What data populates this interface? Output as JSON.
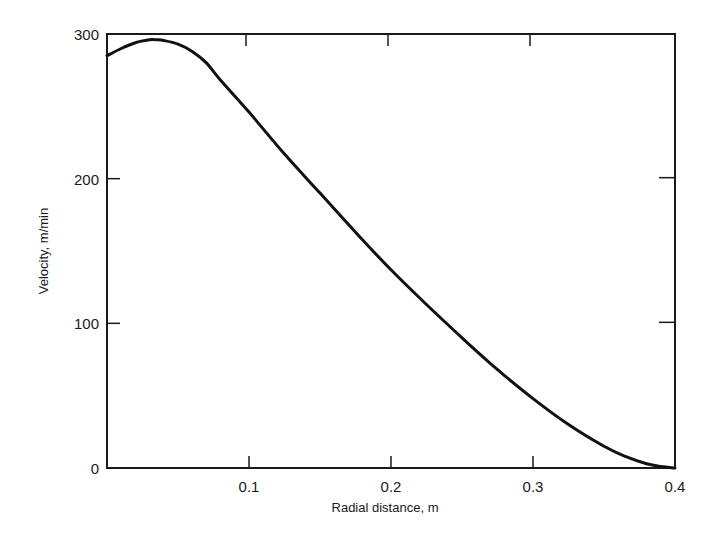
{
  "chart_data": {
    "type": "line",
    "title": "",
    "xlabel": "Radial distance, m",
    "ylabel": "Velocity, m/min",
    "xlim": [
      0,
      0.4
    ],
    "ylim": [
      0,
      300
    ],
    "x_ticks": [
      {
        "value": 0.1,
        "label": "0.1"
      },
      {
        "value": 0.2,
        "label": "0.2"
      },
      {
        "value": 0.3,
        "label": "0.3"
      },
      {
        "value": 0.4,
        "label": "0.4"
      }
    ],
    "y_ticks": [
      {
        "value": 0,
        "label": "0"
      },
      {
        "value": 100,
        "label": "100"
      },
      {
        "value": 200,
        "label": "200"
      },
      {
        "value": 300,
        "label": "300"
      }
    ],
    "grid": false,
    "legend": null,
    "series": [
      {
        "name": "Velocity profile",
        "x": [
          0.0,
          0.01,
          0.02,
          0.03,
          0.035,
          0.04,
          0.05,
          0.06,
          0.07,
          0.08,
          0.1,
          0.125,
          0.15,
          0.175,
          0.2,
          0.225,
          0.25,
          0.275,
          0.3,
          0.325,
          0.35,
          0.365,
          0.38,
          0.39,
          0.4
        ],
        "y": [
          285,
          290,
          294,
          296,
          296,
          295.5,
          293,
          288,
          280,
          268,
          246,
          217,
          190,
          163,
          137,
          113,
          90,
          68,
          48,
          30,
          15,
          8,
          3,
          1,
          0
        ]
      }
    ]
  }
}
